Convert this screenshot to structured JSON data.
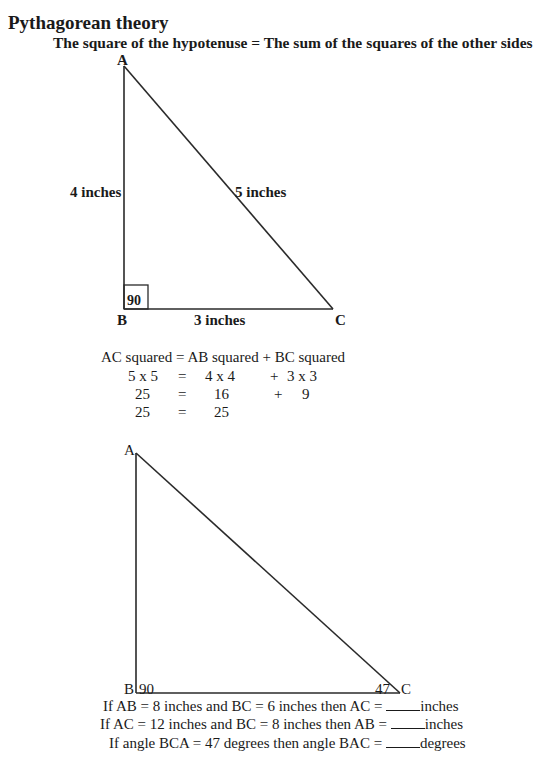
{
  "header": {
    "title": "Pythagorean theory",
    "subtitle": "The square of the hypotenuse = The sum of the squares of the other sides"
  },
  "triangle1": {
    "vertex_a": "A",
    "vertex_b": "B",
    "vertex_c": "C",
    "side_ab": "4 inches",
    "side_ac": "5 inches",
    "side_bc": "3 inches",
    "right_angle": "90"
  },
  "equation": {
    "row1": [
      "AC squared",
      "=",
      "AB squared",
      "+",
      "BC squared"
    ],
    "row2": [
      "5 x 5",
      "=",
      "4 x 4",
      "+",
      "3 x 3"
    ],
    "row3": [
      "25",
      "=",
      "16",
      "+",
      "9"
    ],
    "row4": [
      "25",
      "=",
      "25"
    ]
  },
  "triangle2": {
    "vertex_a": "A",
    "vertex_b": "B",
    "vertex_c": "C",
    "angle_b": "90",
    "angle_c": "47"
  },
  "questions": [
    {
      "prefix": "If AB = 8 inches and BC = 6 inches then AC =",
      "blank": "_____",
      "suffix": "inches"
    },
    {
      "prefix": "If AC = 12 inches and BC = 8 inches then AB =",
      "blank": "_____",
      "suffix": "inches"
    },
    {
      "prefix": "If angle BCA = 47 degrees then angle BAC =",
      "blank": "_____",
      "suffix": "degrees"
    }
  ]
}
